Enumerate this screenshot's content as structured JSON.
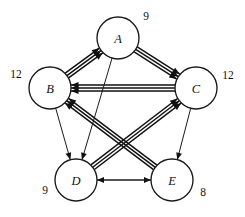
{
  "figure": {
    "type": "directed-multigraph",
    "title": "",
    "background_color": "#ffffff",
    "stroke_color": "#111111",
    "node_fill": "#ffffff",
    "width": 245,
    "height": 217
  },
  "nodes": [
    {
      "id": "A",
      "label": "A",
      "weight": "9",
      "cx": 118,
      "cy": 38,
      "r": 21,
      "weight_x": 146,
      "weight_y": 16
    },
    {
      "id": "B",
      "label": "B",
      "weight": "12",
      "cx": 50,
      "cy": 88,
      "r": 21,
      "weight_x": 16,
      "weight_y": 74
    },
    {
      "id": "C",
      "label": "C",
      "weight": "12",
      "cx": 196,
      "cy": 88,
      "r": 21,
      "weight_x": 228,
      "weight_y": 75
    },
    {
      "id": "D",
      "label": "D",
      "weight": "9",
      "cx": 76,
      "cy": 180,
      "r": 21,
      "weight_x": 45,
      "weight_y": 190
    },
    {
      "id": "E",
      "label": "E",
      "weight": "8",
      "cx": 172,
      "cy": 180,
      "r": 21,
      "weight_x": 203,
      "weight_y": 192
    }
  ],
  "edges": [
    {
      "from": "B",
      "to": "A",
      "multiplicity": 3,
      "style": "thick-bundle",
      "arrow_at": "A"
    },
    {
      "from": "A",
      "to": "C",
      "multiplicity": 3,
      "style": "thick-bundle",
      "arrow_at": "C"
    },
    {
      "from": "C",
      "to": "B",
      "multiplicity": 3,
      "style": "thick-bundle",
      "arrow_at": "B"
    },
    {
      "from": "E",
      "to": "B",
      "multiplicity": 3,
      "style": "thick-bundle",
      "arrow_at": "B"
    },
    {
      "from": "D",
      "to": "C",
      "multiplicity": 3,
      "style": "thick-bundle",
      "arrow_at": "C"
    },
    {
      "from": "A",
      "to": "D",
      "multiplicity": 1,
      "style": "thin",
      "arrow_at": "D"
    },
    {
      "from": "B",
      "to": "D",
      "multiplicity": 1,
      "style": "thin",
      "arrow_at": "D"
    },
    {
      "from": "C",
      "to": "E",
      "multiplicity": 1,
      "style": "thin",
      "arrow_at": "E"
    },
    {
      "from": "D",
      "to": "E",
      "multiplicity": 1,
      "style": "thin",
      "arrow_at": "E"
    },
    {
      "from": "E",
      "to": "D",
      "multiplicity": 1,
      "style": "thin",
      "arrow_at": "D"
    }
  ],
  "weights_summary": {
    "A": "9",
    "B": "12",
    "C": "12",
    "D": "9",
    "E": "8"
  }
}
